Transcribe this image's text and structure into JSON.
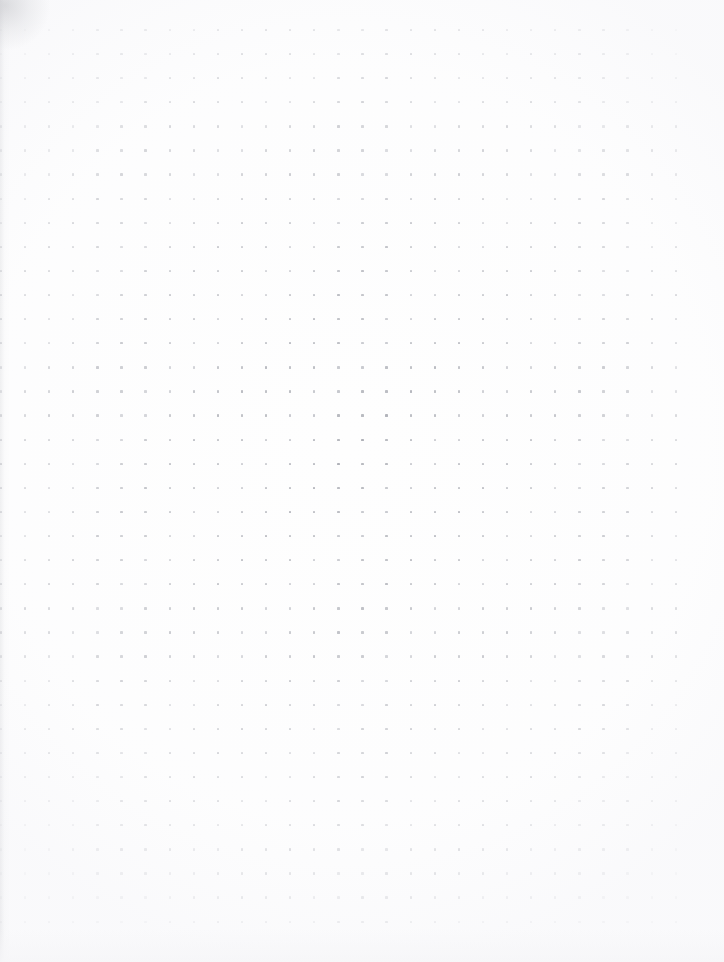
{
  "page": {
    "kind": "dot-grid-notebook-page",
    "width": 724,
    "height": 962,
    "background_color": "#ffffff",
    "paper_tone": "#fefefe",
    "content_text": "",
    "has_handwriting": false,
    "has_printed_text": false
  },
  "grid": {
    "dot_color": "#b6b8be",
    "dot_size_px": 2.4,
    "spacing_px": 24.1,
    "columns": 29,
    "rows": 38,
    "origin_x": 1,
    "origin_y": 30,
    "first_dot_x": 1,
    "first_dot_y": 30,
    "last_dot_x": 676,
    "last_dot_y": 934,
    "right_margin_px": 48,
    "bottom_margin_px": 28,
    "left_margin_px": 0,
    "top_margin_px": 30
  },
  "artifacts": {
    "corner_smudge_label": "top-left scan smudge",
    "gutter_shade_label": "left edge gutter shading",
    "bottom_shade_label": "bottom edge shading"
  }
}
